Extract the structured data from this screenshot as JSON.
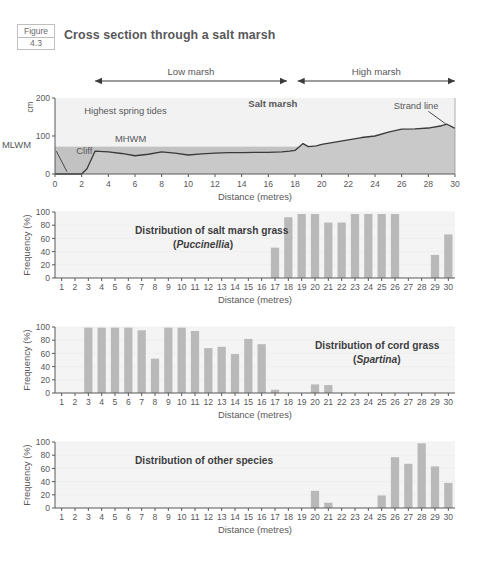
{
  "figure": {
    "label_word": "Figure",
    "label_number": "4.3",
    "title": "Cross section through a salt marsh"
  },
  "colors": {
    "bar_fill": "#b9b9b9",
    "plot_bg": "#f4f4f4",
    "ground_fill": "#c9c9c9",
    "upper_fill": "#f2f2f2",
    "water_band": "#c2c2c2",
    "line": "#3a3a3a",
    "text": "#58585a"
  },
  "cross_section": {
    "type": "area",
    "title": "Salt marsh",
    "xlabel": "Distance (metres)",
    "ylabel": "cm",
    "ylim": [
      0,
      200
    ],
    "xlim": [
      0,
      30
    ],
    "yticks": [
      0,
      100,
      200
    ],
    "xticks": [
      0,
      2,
      4,
      6,
      8,
      10,
      12,
      14,
      16,
      18,
      20,
      22,
      24,
      26,
      28,
      30
    ],
    "spans": [
      {
        "name": "Low marsh",
        "from": 3,
        "to": 17.4
      },
      {
        "name": "High marsh",
        "from": 18.2,
        "to": 30
      }
    ],
    "annotations": [
      {
        "text": "Highest spring tides",
        "x": 2.2,
        "y": 158
      },
      {
        "text": "MHWM",
        "x": 4.5,
        "y": 84
      },
      {
        "text": "MLWM",
        "x": -0.2,
        "y": 68
      },
      {
        "text": "Cliff",
        "x": 1.6,
        "y": 52
      },
      {
        "text": "Salt marsh",
        "x": 14.5,
        "y": 176,
        "bold": true
      },
      {
        "text": "Strand line",
        "x": 25.4,
        "y": 172
      }
    ],
    "water_band": {
      "top": 72,
      "bottom": 0
    },
    "profile": {
      "x": [
        0,
        1,
        2,
        2.4,
        3,
        4,
        5,
        6,
        7,
        8,
        9,
        10,
        11,
        12,
        13,
        14,
        15,
        16,
        17,
        17.6,
        18,
        18.6,
        19,
        19.6,
        20,
        21,
        22,
        23,
        24,
        25,
        26,
        27,
        28,
        29,
        29.4,
        30
      ],
      "y": [
        0,
        0,
        0,
        14,
        60,
        58,
        54,
        48,
        52,
        58,
        55,
        50,
        53,
        55,
        56,
        56,
        57,
        57,
        58,
        60,
        62,
        80,
        72,
        74,
        78,
        84,
        90,
        96,
        100,
        110,
        118,
        119,
        121,
        127,
        131,
        120
      ]
    }
  },
  "bar_charts": [
    {
      "id": "puccinellia",
      "type": "bar",
      "title_line1": "Distribution of salt marsh grass",
      "title_line2_pre": "(",
      "title_line2_italic": "Puccinellia",
      "title_line2_post": ")",
      "title_x": 6.0,
      "title_align": "left",
      "xlabel": "Distance (metres)",
      "ylabel": "Frequency (%)",
      "ylim": [
        0,
        100
      ],
      "yticks": [
        0,
        20,
        40,
        60,
        80,
        100
      ],
      "categories": [
        1,
        2,
        3,
        4,
        5,
        6,
        7,
        8,
        9,
        10,
        11,
        12,
        13,
        14,
        15,
        16,
        17,
        18,
        19,
        20,
        21,
        22,
        23,
        24,
        25,
        26,
        27,
        28,
        29,
        30
      ],
      "values": [
        0,
        0,
        0,
        0,
        0,
        0,
        0,
        0,
        0,
        0,
        0,
        0,
        0,
        0,
        0,
        0,
        46,
        92,
        97,
        97,
        84,
        84,
        97,
        97,
        97,
        97,
        0,
        0,
        35,
        66
      ]
    },
    {
      "id": "spartina",
      "type": "bar",
      "title_line1": "Distribution of cord grass",
      "title_line2_pre": "(",
      "title_line2_italic": "Spartina",
      "title_line2_post": ")",
      "title_x": 19.5,
      "title_align": "left",
      "xlabel": "Distance (metres)",
      "ylabel": "Frequency (%)",
      "ylim": [
        0,
        100
      ],
      "yticks": [
        0,
        20,
        40,
        60,
        80,
        100
      ],
      "categories": [
        1,
        2,
        3,
        4,
        5,
        6,
        7,
        8,
        9,
        10,
        11,
        12,
        13,
        14,
        15,
        16,
        17,
        18,
        19,
        20,
        21,
        22,
        23,
        24,
        25,
        26,
        27,
        28,
        29,
        30
      ],
      "values": [
        0,
        0,
        99,
        99,
        99,
        99,
        95,
        52,
        99,
        99,
        94,
        68,
        70,
        59,
        82,
        74,
        5,
        0,
        0,
        13,
        12,
        0,
        0,
        0,
        0,
        0,
        0,
        0,
        0,
        0
      ]
    },
    {
      "id": "other-species",
      "type": "bar",
      "title_line1": "Distribution of other species",
      "title_line2_pre": "",
      "title_line2_italic": "",
      "title_line2_post": "",
      "title_x": 6.0,
      "title_align": "left",
      "xlabel": "Distance (metres)",
      "ylabel": "Frequency (%)",
      "ylim": [
        0,
        100
      ],
      "yticks": [
        0,
        20,
        40,
        60,
        80,
        100
      ],
      "categories": [
        1,
        2,
        3,
        4,
        5,
        6,
        7,
        8,
        9,
        10,
        11,
        12,
        13,
        14,
        15,
        16,
        17,
        18,
        19,
        20,
        21,
        22,
        23,
        24,
        25,
        26,
        27,
        28,
        29,
        30
      ],
      "values": [
        0,
        0,
        0,
        0,
        0,
        0,
        0,
        0,
        0,
        0,
        0,
        0,
        0,
        0,
        0,
        0,
        0,
        0,
        0,
        26,
        8,
        0,
        0,
        0,
        19,
        77,
        67,
        98,
        63,
        38
      ]
    }
  ]
}
